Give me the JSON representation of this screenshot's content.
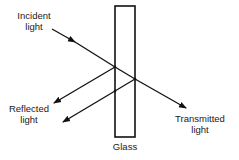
{
  "diagram": {
    "labels": {
      "incident_line1": "Incident",
      "incident_line2": "light",
      "reflected_line1": "Reflected",
      "reflected_line2": "light",
      "transmitted_line1": "Transmitted",
      "transmitted_line2": "light",
      "glass": "Glass"
    },
    "colors": {
      "stroke": "#111111",
      "background": "#ffffff"
    }
  }
}
